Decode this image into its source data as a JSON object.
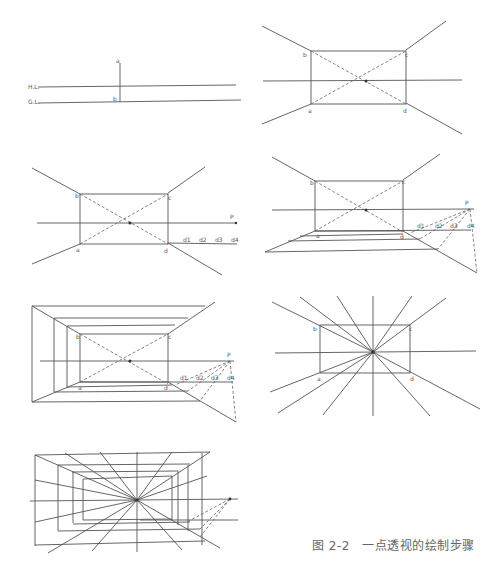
{
  "caption": "图 2-2　一点透视的绘制步骤",
  "panels": [
    {
      "step": 1,
      "labels": {
        "hl": "H.L.",
        "gl": "G.L.",
        "a": "a",
        "b": "b"
      }
    },
    {
      "step": 2,
      "labels": {
        "a": "a",
        "b": "b",
        "c": "c",
        "d": "d"
      }
    },
    {
      "step": 3,
      "labels": {
        "a": "a",
        "b": "b",
        "c": "c",
        "d": "d",
        "p": "P",
        "d1": "d1",
        "d2": "d2",
        "d3": "d3",
        "d4": "d4"
      }
    },
    {
      "step": 4,
      "labels": {
        "a": "a",
        "b": "b",
        "c": "c",
        "d": "d",
        "p": "P",
        "d1": "d1",
        "d2": "d2",
        "d3": "d3",
        "d4": "d4"
      }
    },
    {
      "step": 5,
      "labels": {
        "b": "b",
        "c": "c",
        "a": "a",
        "d": "d",
        "p": "P",
        "d1": "d1",
        "d2": "d2",
        "d3": "d3",
        "d4": "d4"
      }
    },
    {
      "step": 6,
      "labels": {
        "a": "a",
        "b": "b",
        "c": "c",
        "d": "d"
      }
    },
    {
      "step": 7,
      "labels": {}
    }
  ]
}
